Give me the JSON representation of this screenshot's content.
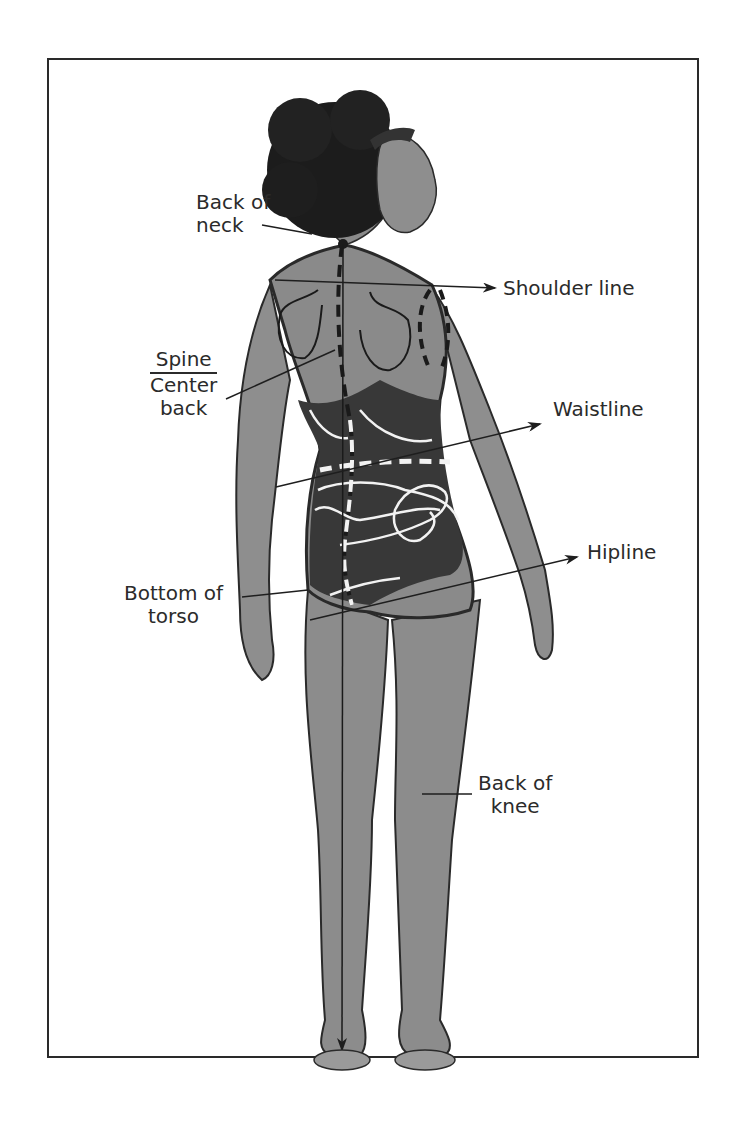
{
  "figure": {
    "labels": {
      "back_of_neck": [
        "Back of",
        "neck"
      ],
      "shoulder_line": "Shoulder line",
      "spine": "Spine",
      "center_back": [
        "Center",
        "back"
      ],
      "waistline": "Waistline",
      "hipline": "Hipline",
      "bottom_of_torso": [
        "Bottom of",
        "torso"
      ],
      "back_of_knee": [
        "Back of",
        "knee"
      ]
    },
    "colors": {
      "border": "#2a2a2a",
      "text": "#2b2b2b",
      "skin": "#8a8a8a",
      "swimsuit": "#3a3a3a",
      "hair": "#1e1e1e",
      "guide_white": "#f2f2f2"
    }
  }
}
